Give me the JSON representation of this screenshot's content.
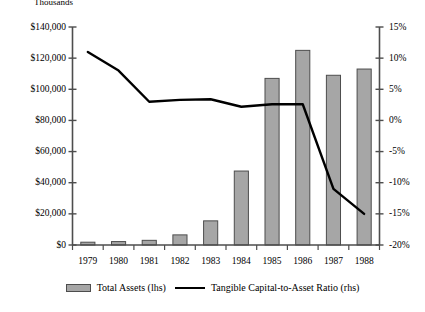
{
  "chart_data": {
    "type": "bar",
    "title": "Thousands",
    "xlabel": "",
    "ylabel": "",
    "grid": false,
    "legend_position": "bottom",
    "categories": [
      "1979",
      "1980",
      "1981",
      "1982",
      "1983",
      "1984",
      "1985",
      "1986",
      "1987",
      "1988"
    ],
    "series": [
      {
        "name": "Total Assets (lhs)",
        "type": "bar",
        "axis": "left",
        "unit": "thousands of dollars",
        "color": "#a6a6a6",
        "values": [
          1800,
          2200,
          3000,
          6500,
          15500,
          47500,
          107000,
          125000,
          109000,
          113000
        ]
      },
      {
        "name": "Tangible Capital-to-Asset Ratio (rhs)",
        "type": "line",
        "axis": "right",
        "unit": "percent",
        "color": "#000000",
        "values": [
          11.0,
          8.0,
          3.0,
          3.3,
          3.4,
          2.2,
          2.6,
          2.6,
          -11.0,
          -15.0
        ]
      }
    ],
    "left_axis": {
      "ylim": [
        0,
        140000
      ],
      "tick_values": [
        0,
        20000,
        40000,
        60000,
        80000,
        100000,
        120000,
        140000
      ],
      "tick_labels": [
        "$0",
        "$20,000",
        "$40,000",
        "$60,000",
        "$80,000",
        "$100,000",
        "$120,000",
        "$140,000"
      ]
    },
    "right_axis": {
      "ylim": [
        -20,
        15
      ],
      "tick_values": [
        -20,
        -15,
        -10,
        -5,
        0,
        5,
        10,
        15
      ],
      "tick_labels": [
        "-20%",
        "-15%",
        "-10%",
        "-5%",
        "0%",
        "5%",
        "10%",
        "15%"
      ]
    }
  },
  "legend": {
    "bar_label": "Total Assets (lhs)",
    "line_label": "Tangible Capital-to-Asset Ratio (rhs)"
  },
  "colors": {
    "bar_fill": "#a6a6a6",
    "bar_stroke": "#4d4d4d",
    "line": "#000000",
    "axis": "#4d4d4d",
    "background": "#ffffff"
  }
}
